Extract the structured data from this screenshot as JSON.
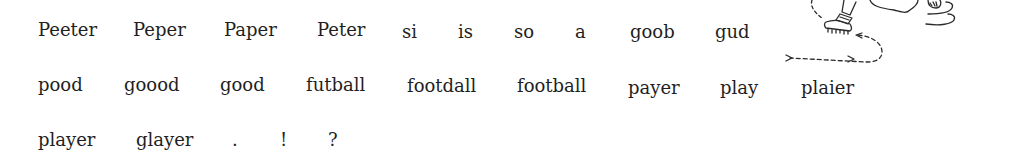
{
  "rows": [
    {
      "words": [
        "Peeter",
        "Peper",
        "Paper",
        "Peter",
        "si",
        "is",
        "so",
        "a",
        "goob",
        "gud"
      ]
    },
    {
      "words": [
        "pood",
        "goood",
        "good",
        "futball",
        "footdall",
        "football",
        "payer",
        "play",
        "plaier"
      ]
    },
    {
      "words": [
        "player",
        "glayer",
        ".",
        "!",
        "?"
      ]
    }
  ],
  "illustration": {
    "icon": "running-footballer-drawing-icon"
  }
}
